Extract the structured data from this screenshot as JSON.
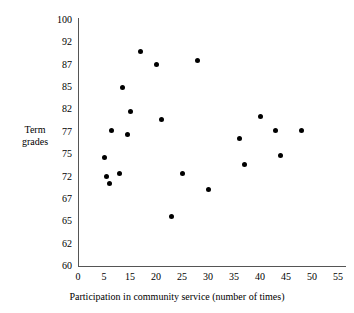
{
  "chart_data": {
    "type": "scatter",
    "title": "",
    "xlabel": "Participation in community service (number of times)",
    "ylabel": "Term grades",
    "xticklabels": [
      "0",
      "5",
      "15",
      "20",
      "25",
      "30",
      "35",
      "40",
      "45",
      "50",
      "55"
    ],
    "yticklabels": [
      "100",
      "92",
      "87",
      "85",
      "82",
      "77",
      "75",
      "72",
      "67",
      "65",
      "62",
      "60"
    ],
    "grid": false,
    "legend": null,
    "xlim": [
      0,
      55
    ],
    "ylim": [
      60,
      100
    ],
    "note": "Tick labels are evenly spaced on both axes but the printed values are non-uniform; the x-axis omits 10.",
    "points": [
      {
        "x": 6,
        "y": 72.0
      },
      {
        "x": 5,
        "y": 74.5
      },
      {
        "x": 8,
        "y": 77.3
      },
      {
        "x": 7,
        "y": 70.4
      },
      {
        "x": 12,
        "y": 85.0
      },
      {
        "x": 11,
        "y": 72.4
      },
      {
        "x": 17,
        "y": 90.0
      },
      {
        "x": 15,
        "y": 81.6
      },
      {
        "x": 14,
        "y": 76.8
      },
      {
        "x": 20,
        "y": 87.0
      },
      {
        "x": 21,
        "y": 79.8
      },
      {
        "x": 23,
        "y": 65.4
      },
      {
        "x": 25,
        "y": 72.4
      },
      {
        "x": 28,
        "y": 88.0
      },
      {
        "x": 30,
        "y": 69.0
      },
      {
        "x": 36,
        "y": 76.4
      },
      {
        "x": 37,
        "y": 73.6
      },
      {
        "x": 40,
        "y": 80.5
      },
      {
        "x": 43,
        "y": 77.4
      },
      {
        "x": 44,
        "y": 74.8
      },
      {
        "x": 48,
        "y": 77.4
      }
    ]
  },
  "axes_geometry": {
    "x_px_min": 78,
    "x_px_max": 338,
    "y_px_min": 266,
    "y_px_max": 20
  }
}
